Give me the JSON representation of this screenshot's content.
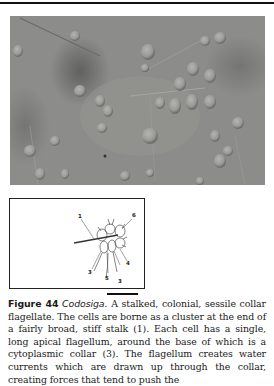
{
  "figure": {
    "label": "Figure 44",
    "genus": "Codosiga",
    "caption_body": ". A stalked, colonial, sessile collar flagellate. The cells are borne as a cluster at the end of a fairly broad, stiff stalk (1). Each cell has a single, long apical flagellum, around the base of which is a cytoplasmic collar (3). The flagellum creates water currents which are drawn up through the collar, creating forces that tend to push the"
  },
  "photo": {
    "description": "Micrograph of Codosiga colonies on stalks",
    "background_color": "#8a8a88"
  },
  "diagram": {
    "labels": [
      {
        "id": "1",
        "text": "1"
      },
      {
        "id": "6",
        "text": "6"
      },
      {
        "id": "4",
        "text": "4"
      },
      {
        "id": "3a",
        "text": "3"
      },
      {
        "id": "5",
        "text": "5"
      },
      {
        "id": "3b",
        "text": "3"
      }
    ]
  }
}
